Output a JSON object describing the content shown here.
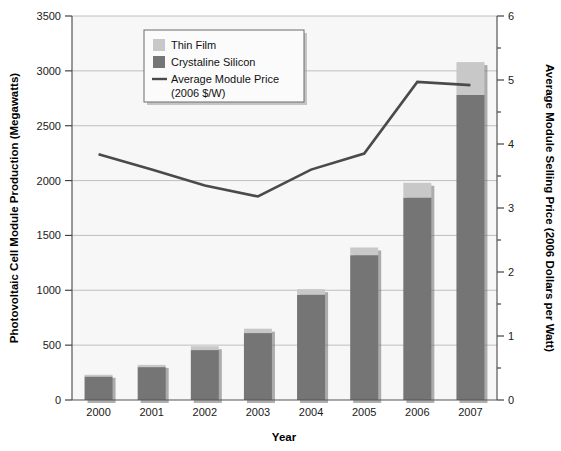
{
  "chart_data": {
    "type": "bar",
    "title": "",
    "xlabel": "Year",
    "ylabel": "Photovoltaic Cell Module Production (Megawatts)",
    "y2label": "Average Module Selling Price (2006 Dollars per Watt)",
    "categories": [
      "2000",
      "2001",
      "2002",
      "2003",
      "2004",
      "2005",
      "2006",
      "2007"
    ],
    "ylim": [
      0,
      3500
    ],
    "yticks": [
      "0",
      "500",
      "1000",
      "1500",
      "2000",
      "2500",
      "3000",
      "3500"
    ],
    "ytick_values": [
      0,
      500,
      1000,
      1500,
      2000,
      2500,
      3000,
      3500
    ],
    "y2lim": [
      0,
      6
    ],
    "y2ticks": [
      "0",
      "1",
      "2",
      "3",
      "4",
      "5",
      "6"
    ],
    "y2tick_values": [
      0,
      1,
      2,
      3,
      4,
      5,
      6
    ],
    "grid": true,
    "stacked": true,
    "legend_position": "upper-left-inside",
    "series": [
      {
        "name": "Crystaline Silicon",
        "type": "bar",
        "color": "#757575",
        "axis": "left",
        "values": [
          215,
          300,
          455,
          610,
          960,
          1320,
          1845,
          2780
        ]
      },
      {
        "name": "Thin Film",
        "type": "bar",
        "color": "#c8c8c8",
        "axis": "left",
        "values": [
          15,
          20,
          35,
          40,
          50,
          70,
          135,
          300
        ]
      },
      {
        "name": "Average Module Price (2006 $/W)",
        "type": "line",
        "color": "#4a4a4a",
        "axis": "right",
        "values": [
          3.84,
          3.6,
          3.35,
          3.18,
          3.6,
          3.85,
          4.97,
          4.92
        ]
      }
    ],
    "totals": [
      230,
      320,
      490,
      650,
      1010,
      1390,
      1980,
      3080
    ]
  },
  "legend": {
    "items": [
      {
        "label": "Thin Film",
        "marker": "swatch",
        "color": "#c8c8c8"
      },
      {
        "label": "Crystaline Silicon",
        "marker": "swatch",
        "color": "#757575"
      },
      {
        "label": "Average Module Price",
        "marker": "line",
        "color": "#4a4a4a"
      },
      {
        "label": "(2006 $/W)",
        "marker": "none",
        "color": "#4a4a4a"
      }
    ]
  },
  "colors": {
    "thin_film": "#c8c8c8",
    "crystaline_silicon": "#757575",
    "price_line": "#4a4a4a",
    "gridline": "#b9b9b9",
    "axis": "#555555",
    "plot_background": "#f7f7f7",
    "page_background": "#ffffff"
  }
}
